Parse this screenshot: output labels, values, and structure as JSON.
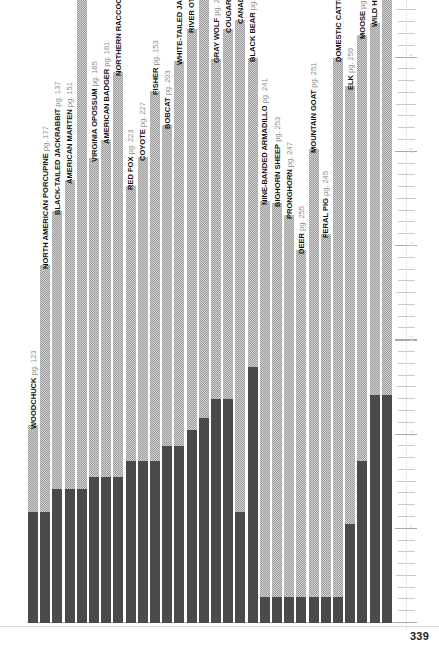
{
  "page": {
    "number": "339",
    "accent_dark": "#4a4a4a",
    "accent_hatch": "#9d9d9d",
    "baseline_color": "#b9b9b9"
  },
  "ruler": {
    "label": "right-edge-ruler",
    "numbers": [
      "6",
      "5",
      "4",
      "3",
      "2",
      "1"
    ]
  },
  "chart_data": {
    "type": "bar",
    "title": "",
    "subtitle": "",
    "xlabel": "",
    "ylabel": "",
    "grid": false,
    "legend": "none",
    "ylim": [
      0,
      6.6
    ],
    "note": "Each bar is split into a dark solid lower segment and a light hatched upper segment; bars sorted ascending by total height. Values are read off the right-hand ruler in inches.",
    "categories": [
      "WOODCHUCK",
      "NORTH AMERICAN PORCUPINE",
      "BLACK-TAILED JACKRABBIT",
      "AMERICAN MARTEN",
      "SNOWSHOE HARE",
      "VIRGINIA OPOSSUM",
      "AMERICAN BADGER",
      "NORTHERN RACCOON",
      "RED FOX",
      "COYOTE",
      "FISHER",
      "BOBCAT",
      "WHITE-TAILED JACKRABBIT",
      "RIVER OTTER",
      "AMERICAN BEAVER",
      "GRAY WOLF",
      "COUGAR",
      "CANADA LYNX",
      "BLACK BEAR",
      "NINE-BANDED ARMADILLO",
      "BIGHORN SHEEP",
      "PRONGHORN",
      "DEER",
      "MOUNTAIN GOAT",
      "FERAL PIG",
      "DOMESTIC CATTLE",
      "ELK",
      "MOOSE",
      "WILD HORSE",
      "AMERICAN BISON"
    ],
    "pages": [
      "pg. 123",
      "pg. 177",
      "pg. 137",
      "pg. 151",
      "pg. 133",
      "pg. 185",
      "pg. 161",
      "pg. 189",
      "pg. 223",
      "pg. 227",
      "pg. 153",
      "pg. 203",
      "pg. 137",
      "pg. 157",
      "pg. 181",
      "pg. 235",
      "pg. 211",
      "pg. 207",
      "pg. 193",
      "pg. 241",
      "pg. 253",
      "pg. 247",
      "pg. 255",
      "pg. 251",
      "pg. 245",
      "pg. 271",
      "pg. 259",
      "pg. 263",
      "pg. 273",
      "pg. 267"
    ],
    "series": [
      {
        "name": "solid lower segment",
        "values": [
          1.18,
          1.18,
          1.42,
          1.42,
          1.42,
          1.55,
          1.55,
          1.55,
          1.72,
          1.72,
          1.72,
          1.88,
          1.88,
          2.05,
          2.18,
          2.38,
          2.38,
          1.18,
          2.72,
          0.28,
          0.28,
          0.28,
          0.28,
          0.28,
          0.28,
          0.28,
          1.05,
          1.72,
          2.42,
          2.42
        ]
      },
      {
        "name": "hatched upper segment",
        "values": [
          0.92,
          2.62,
          2.95,
          3.28,
          5.65,
          3.38,
          3.58,
          4.3,
          2.92,
          3.22,
          3.92,
          3.4,
          4.08,
          4.25,
          4.62,
          3.6,
          3.92,
          5.22,
          3.28,
          4.2,
          4.18,
          4.05,
          3.68,
          4.75,
          3.85,
          5.72,
          4.65,
          4.52,
          3.95,
          4.58
        ]
      }
    ],
    "totals": [
      2.1,
      3.8,
      4.37,
      4.7,
      7.07,
      4.93,
      5.13,
      5.85,
      4.64,
      4.94,
      5.64,
      5.28,
      5.96,
      6.3,
      6.8,
      5.98,
      6.3,
      6.4,
      6.0,
      4.48,
      4.46,
      4.33,
      3.96,
      5.03,
      4.13,
      6.0,
      5.7,
      6.24,
      6.37,
      7.0
    ]
  }
}
